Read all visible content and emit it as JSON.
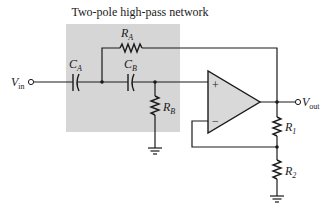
{
  "diagram": {
    "title": "Two-pole high-pass network",
    "colors": {
      "shaded_region": "#d6d6d6",
      "opamp_fill": "#d9d9d9",
      "line": "#1a1a1a",
      "background": "#ffffff"
    },
    "terminals": {
      "input": {
        "main": "V",
        "sub": "in"
      },
      "output": {
        "main": "V",
        "sub": "out"
      }
    },
    "components": {
      "ca": {
        "main": "C",
        "sub": "A",
        "type": "capacitor"
      },
      "cb": {
        "main": "C",
        "sub": "B",
        "type": "capacitor"
      },
      "ra": {
        "main": "R",
        "sub": "A",
        "type": "resistor"
      },
      "rb": {
        "main": "R",
        "sub": "B",
        "type": "resistor"
      },
      "r1": {
        "main": "R",
        "sub": "1",
        "type": "resistor"
      },
      "r2": {
        "main": "R",
        "sub": "2",
        "type": "resistor"
      }
    },
    "opamp": {
      "plus": "+",
      "minus": "−"
    }
  }
}
